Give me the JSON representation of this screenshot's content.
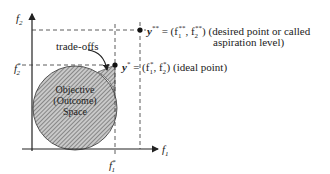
{
  "diagram": {
    "axes": {
      "x_label": "f",
      "x_sub": "1",
      "y_label": "f",
      "y_sub": "2"
    },
    "ticks": {
      "x_tick": "f",
      "x_tick_sub": "1",
      "x_tick_sup": "*",
      "y_tick": "f",
      "y_tick_sub": "2",
      "y_tick_sup": "*"
    },
    "region": {
      "line1": "Objective",
      "line2": "(Outcome)",
      "line3": "Space"
    },
    "annotation": "trade-offs",
    "points": {
      "ideal": {
        "symbol": "y",
        "sup": "*",
        "eq": "= (f",
        "eq2": ", f",
        "close": ")",
        "desc": "(ideal point)"
      },
      "desired": {
        "symbol": "y",
        "sup": "**",
        "eq": "= (f",
        "eq2": ", f",
        "close": ")",
        "desc1": "(desired point or called",
        "desc2": "aspiration level)"
      }
    },
    "colors": {
      "line": "#222222",
      "fill": "#bfbfbf",
      "hatch": "#555555"
    }
  }
}
